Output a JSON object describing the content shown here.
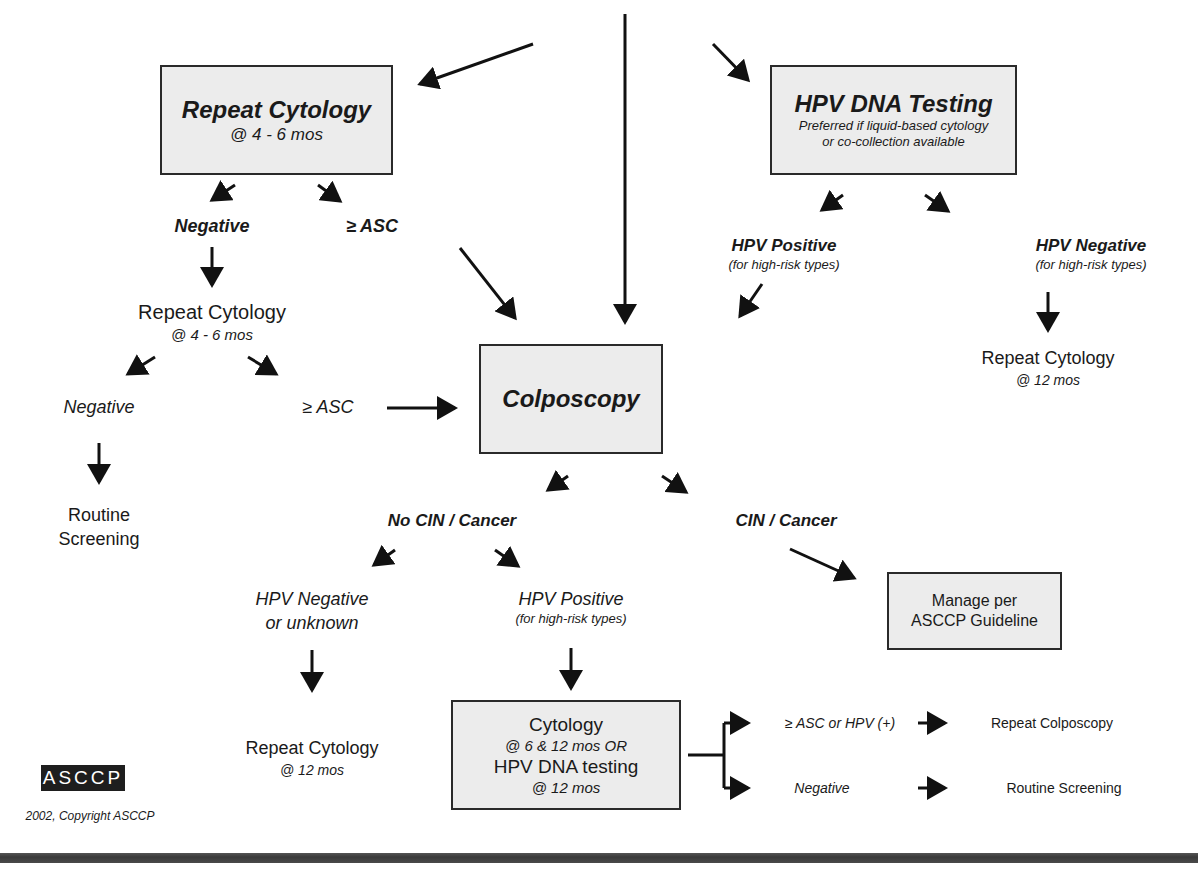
{
  "boxes": {
    "repeat_cytology": {
      "title": "Repeat Cytology",
      "subtitle": "@ 4 - 6 mos"
    },
    "hpv_dna_testing": {
      "title": "HPV DNA Testing",
      "note_line1": "Preferred if liquid-based cytology",
      "note_line2": "or co-collection available"
    },
    "colposcopy": {
      "title": "Colposcopy"
    },
    "manage_per_asccp": {
      "line1": "Manage per",
      "line2": "ASCCP Guideline"
    },
    "followup": {
      "line1": "Cytology",
      "line2": "@ 6 & 12 mos OR",
      "line3": "HPV DNA testing",
      "line4": "@ 12 mos"
    }
  },
  "left_branch": {
    "negative": "Negative",
    "asc": "≥ ASC",
    "repeat_title": "Repeat Cytology",
    "repeat_sub": "@ 4 - 6 mos",
    "negative2": "Negative",
    "asc2": "≥ ASC",
    "routine_line1": "Routine",
    "routine_line2": "Screening"
  },
  "right_branch": {
    "hpv_positive": "HPV Positive",
    "hpv_positive_sub": "(for high-risk types)",
    "hpv_negative": "HPV Negative",
    "hpv_negative_sub": "(for high-risk types)",
    "repeat_title": "Repeat Cytology",
    "repeat_sub": "@ 12 mos"
  },
  "colposcopy_outcomes": {
    "no_cin": "No CIN / Cancer",
    "cin": "CIN / Cancer",
    "hpv_neg_line1": "HPV Negative",
    "hpv_neg_line2": "or unknown",
    "hpv_pos": "HPV Positive",
    "hpv_pos_sub": "(for high-risk types)",
    "repeat_title": "Repeat Cytology",
    "repeat_sub": "@ 12 mos"
  },
  "followup_outcomes": {
    "positive_condition": "≥ ASC or HPV (+)",
    "positive_action": "Repeat Colposcopy",
    "negative_condition": "Negative",
    "negative_action": "Routine Screening"
  },
  "footer": {
    "logo": "ASCCP",
    "copyright": "2002, Copyright ASCCP"
  },
  "colors": {
    "box_fill": "#ececec",
    "box_border": "#2a2a2a",
    "arrow": "#111111",
    "bottom_bar": "#444444"
  }
}
